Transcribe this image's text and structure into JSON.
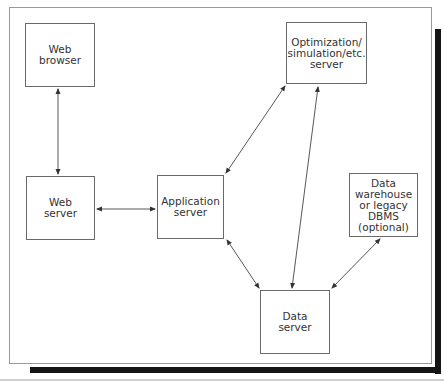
{
  "diagram": {
    "nodes": [
      {
        "id": "web-browser",
        "label": "Web\nbrowser",
        "x": 25,
        "y": 23,
        "w": 70,
        "h": 64
      },
      {
        "id": "web-server",
        "label": "Web\nserver",
        "x": 26,
        "y": 176,
        "w": 69,
        "h": 64
      },
      {
        "id": "application-server",
        "label": "Application\nserver",
        "x": 157,
        "y": 175,
        "w": 67,
        "h": 64
      },
      {
        "id": "optimization-server",
        "label": "Optimization/\nsimulation/etc.\nserver",
        "x": 286,
        "y": 22,
        "w": 81,
        "h": 62
      },
      {
        "id": "data-warehouse",
        "label": "Data\nwarehouse\nor legacy\nDBMS\n(optional)",
        "x": 349,
        "y": 173,
        "w": 69,
        "h": 64
      },
      {
        "id": "data-server",
        "label": "Data\nserver",
        "x": 260,
        "y": 290,
        "w": 70,
        "h": 64
      }
    ],
    "edges": [
      {
        "from": "web-browser",
        "to": "web-server",
        "bidirectional": true
      },
      {
        "from": "web-server",
        "to": "application-server",
        "bidirectional": true
      },
      {
        "from": "application-server",
        "to": "optimization-server",
        "bidirectional": true
      },
      {
        "from": "application-server",
        "to": "data-server",
        "bidirectional": true
      },
      {
        "from": "optimization-server",
        "to": "data-server",
        "bidirectional": true
      },
      {
        "from": "data-warehouse",
        "to": "data-server",
        "bidirectional": true
      }
    ]
  }
}
